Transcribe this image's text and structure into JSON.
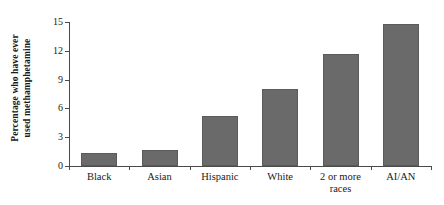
{
  "chart_data": {
    "type": "bar",
    "title": "",
    "xlabel": "",
    "ylabel": "Percentage who have ever used methamphetamine",
    "ylabel_lines": [
      "Percentage who have ever",
      "used methamphetamine"
    ],
    "categories": [
      "Black",
      "Asian",
      "Hispanic",
      "White",
      "2 or more races",
      "AI/AN"
    ],
    "category_lines": [
      [
        "Black"
      ],
      [
        "Asian"
      ],
      [
        "Hispanic"
      ],
      [
        "White"
      ],
      [
        "2 or more",
        "races"
      ],
      [
        "AI/AN"
      ]
    ],
    "values": [
      1.4,
      1.7,
      5.2,
      8.0,
      11.7,
      14.8
    ],
    "ylim": [
      0,
      15
    ],
    "yticks": [
      0,
      3,
      6,
      9,
      12,
      15
    ],
    "ytick_labels": [
      "0",
      "3",
      "6",
      "9",
      "12",
      "15"
    ],
    "grid": false,
    "legend": false,
    "bar_color": "#6a6a6a",
    "axis_color": "#4a4a4a",
    "background_color": "#ffffff"
  }
}
